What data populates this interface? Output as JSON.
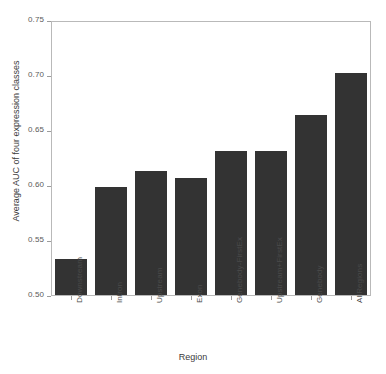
{
  "chart_data": {
    "type": "bar",
    "title": "",
    "xlabel": "Region",
    "ylabel": "Average AUC of four expression classes",
    "categories": [
      "Downstream",
      "Intron",
      "Upstream",
      "Exon",
      "Genebody-FirstEx",
      "Upstream+FirstEx",
      "Genebody",
      "AllRegions"
    ],
    "values": [
      0.534,
      0.599,
      0.614,
      0.607,
      0.632,
      0.632,
      0.665,
      0.703
    ],
    "ylim": [
      0.5,
      0.75
    ],
    "yticks": [
      0.5,
      0.55,
      0.6,
      0.65,
      0.7,
      0.75
    ],
    "ytick_labels": [
      "0.50",
      "0.55",
      "0.60",
      "0.65",
      "0.70",
      "0.75"
    ],
    "grid": false,
    "legend": false,
    "bar_color": "#333333",
    "frame_color": "#b9b9b9",
    "background": "#ffffff"
  }
}
